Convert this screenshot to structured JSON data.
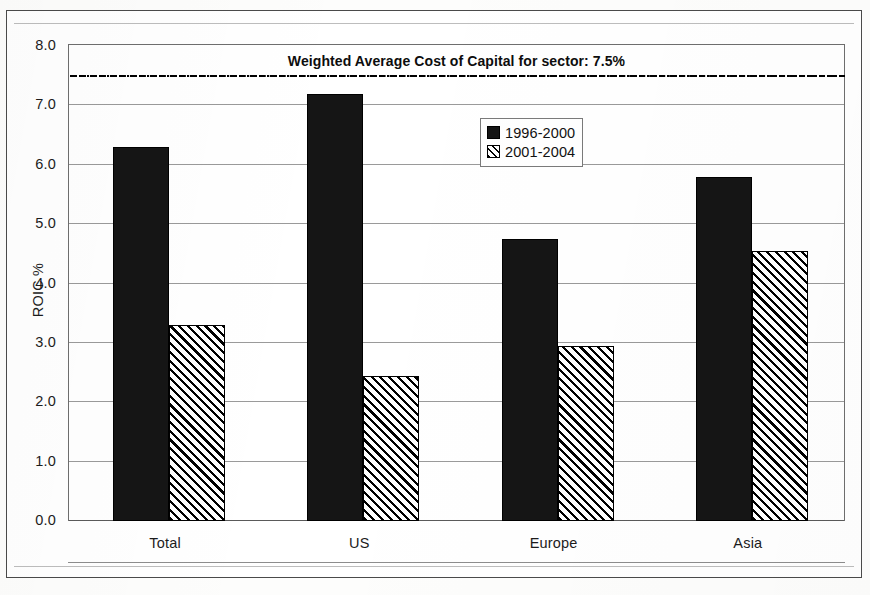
{
  "chart_data": {
    "type": "bar",
    "title": "",
    "xlabel": "",
    "ylabel": "ROIC %",
    "ylim": [
      0.0,
      8.0
    ],
    "ytick_step": 1.0,
    "grid": true,
    "legend_position": "upper-center-right",
    "categories": [
      "Total",
      "US",
      "Europe",
      "Asia"
    ],
    "series": [
      {
        "name": "1996-2000",
        "style": "solid-black",
        "values": [
          6.3,
          7.2,
          4.75,
          5.8
        ]
      },
      {
        "name": "2001-2004",
        "style": "diagonal-hatch",
        "values": [
          3.3,
          2.45,
          2.95,
          4.55
        ]
      }
    ],
    "ytick_labels": [
      "0.0",
      "1.0",
      "2.0",
      "3.0",
      "4.0",
      "5.0",
      "6.0",
      "7.0",
      "8.0"
    ],
    "ytick_values": [
      0,
      1,
      2,
      3,
      4,
      5,
      6,
      7,
      8
    ],
    "annotations": [
      {
        "type": "hline",
        "value": 7.5,
        "label": "Weighted Average Cost of Capital for sector: 7.5%",
        "line_style": "dash-dot",
        "color": "#000000"
      }
    ]
  },
  "legend": {
    "items": [
      {
        "label": "1996-2000"
      },
      {
        "label": "2001-2004"
      }
    ]
  },
  "axis": {
    "y_title": "ROIC %"
  }
}
